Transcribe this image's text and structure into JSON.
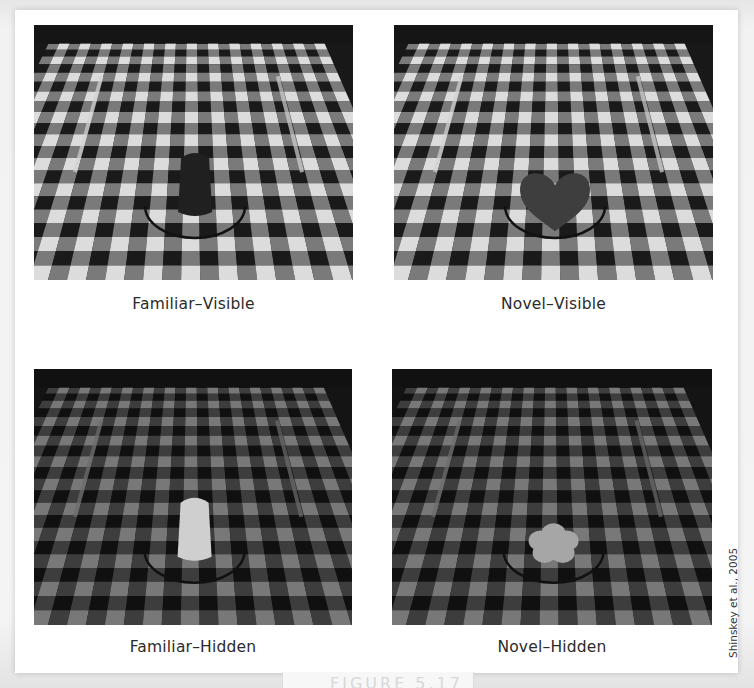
{
  "figure": {
    "credit": "Shinskey et al., 2005",
    "bottom_partial_label": "FIGURE 5.17",
    "panels": [
      {
        "id": "familiar-visible",
        "caption": "Familiar–Visible",
        "object": "dark cylindrical cup (familiar object)",
        "object_shape": "cup",
        "object_tone": "#1a1a1a",
        "lighting": "lit"
      },
      {
        "id": "novel-visible",
        "caption": "Novel–Visible",
        "object": "dark heart-shaped object (novel object)",
        "object_shape": "heart",
        "object_tone": "#3a3a3a",
        "lighting": "lit"
      },
      {
        "id": "familiar-hidden",
        "caption": "Familiar–Hidden",
        "object": "light cylindrical cup in darkness (familiar object)",
        "object_shape": "cup",
        "object_tone": "#d4d4d4",
        "lighting": "dark"
      },
      {
        "id": "novel-hidden",
        "caption": "Novel–Hidden",
        "object": "light flower-shaped object in darkness (novel object)",
        "object_shape": "flower",
        "object_tone": "#a8a8a8",
        "lighting": "dark"
      }
    ]
  },
  "colors": {
    "card": "#ffffff",
    "check_dark": "#141414",
    "check_light": "#e2e2e2",
    "check_mid": "#7a7a7a",
    "caption_text": "#2b2b2b"
  }
}
